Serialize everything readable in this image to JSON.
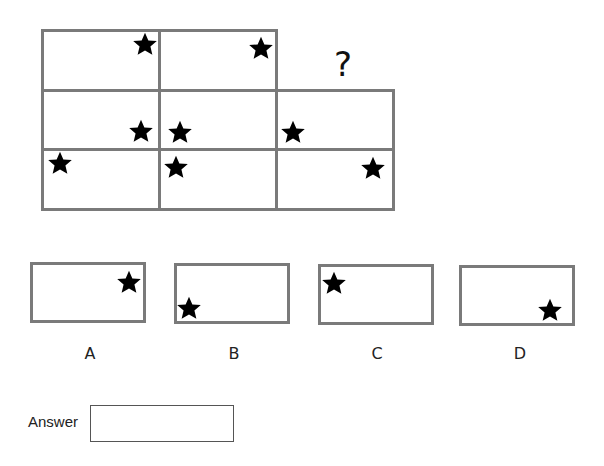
{
  "puzzle": {
    "question_mark": "?",
    "grid": {
      "rows": [
        {
          "cells": [
            {
              "star": "top-right"
            },
            {
              "star": "top-right"
            },
            null
          ]
        },
        {
          "cells": [
            {
              "star": "bottom-right"
            },
            {
              "star": "bottom-left"
            },
            {
              "star": "bottom-left"
            }
          ]
        },
        {
          "cells": [
            {
              "star": "top-left"
            },
            {
              "star": "top-left"
            },
            {
              "star": "top-right"
            }
          ]
        }
      ],
      "missing_cell": "row1-col3"
    },
    "icon": "star-icon",
    "border_color": "#7a7a7a",
    "star_color": "#000000"
  },
  "options": [
    {
      "label": "A",
      "star": "top-right"
    },
    {
      "label": "B",
      "star": "bottom-left"
    },
    {
      "label": "C",
      "star": "top-left"
    },
    {
      "label": "D",
      "star": "bottom-right"
    }
  ],
  "answer": {
    "label": "Answer",
    "value": ""
  }
}
